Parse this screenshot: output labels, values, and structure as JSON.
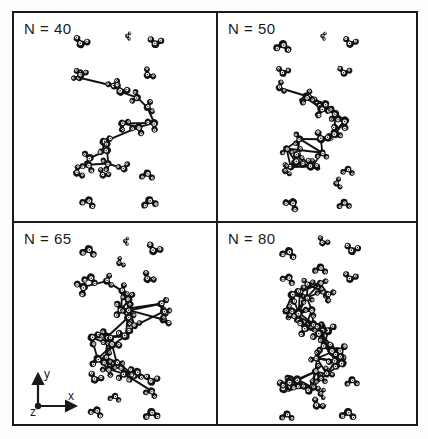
{
  "figure": {
    "type": "molecular-snapshot-grid",
    "border_color": "#1a1a1a",
    "background_color": "#ffffff",
    "molecule_color": "#111111",
    "highlight_color": "#ffffff"
  },
  "axes": {
    "x_label": "x",
    "y_label": "y",
    "z_label": "z",
    "shown_in_panel": "N = 65"
  },
  "panels": [
    {
      "id": "panel-n40",
      "label": "N = 40",
      "n": 40,
      "position": "top-left",
      "cluster": {
        "shape": "branched-chain",
        "center_x": 0.52,
        "center_y": 0.56,
        "molecules": 14,
        "spread_x": 0.16,
        "spread_y": 0.22,
        "seed": 11
      },
      "free_molecules": [
        {
          "x": 0.33,
          "y": 0.15,
          "rot": 20,
          "size": 1.15
        },
        {
          "x": 0.56,
          "y": 0.11,
          "rot": 95,
          "size": 0.6
        },
        {
          "x": 0.7,
          "y": 0.15,
          "rot": 8,
          "size": 1.1
        },
        {
          "x": 0.33,
          "y": 0.3,
          "rot": 10,
          "size": 1.0
        },
        {
          "x": 0.66,
          "y": 0.3,
          "rot": 48,
          "size": 1.0
        },
        {
          "x": 0.31,
          "y": 0.77,
          "rot": 62,
          "size": 1.0
        },
        {
          "x": 0.44,
          "y": 0.78,
          "rot": 30,
          "size": 0.95
        },
        {
          "x": 0.66,
          "y": 0.77,
          "rot": 186,
          "size": 1.05
        },
        {
          "x": 0.37,
          "y": 0.9,
          "rot": 200,
          "size": 1.1
        },
        {
          "x": 0.67,
          "y": 0.9,
          "rot": 172,
          "size": 1.15
        }
      ]
    },
    {
      "id": "panel-n50",
      "label": "N = 50",
      "n": 50,
      "position": "top-right",
      "cluster": {
        "shape": "compact-diamond",
        "center_x": 0.5,
        "center_y": 0.56,
        "molecules": 18,
        "spread_x": 0.17,
        "spread_y": 0.19,
        "seed": 23
      },
      "free_molecules": [
        {
          "x": 0.33,
          "y": 0.15,
          "rot": 188,
          "size": 1.2
        },
        {
          "x": 0.53,
          "y": 0.11,
          "rot": 100,
          "size": 0.6
        },
        {
          "x": 0.67,
          "y": 0.15,
          "rot": 15,
          "size": 1.05
        },
        {
          "x": 0.33,
          "y": 0.29,
          "rot": 10,
          "size": 1.0
        },
        {
          "x": 0.64,
          "y": 0.29,
          "rot": 12,
          "size": 1.0
        },
        {
          "x": 0.34,
          "y": 0.76,
          "rot": 70,
          "size": 0.85
        },
        {
          "x": 0.47,
          "y": 0.74,
          "rot": 32,
          "size": 1.05
        },
        {
          "x": 0.66,
          "y": 0.75,
          "rot": 188,
          "size": 0.95
        },
        {
          "x": 0.6,
          "y": 0.82,
          "rot": 80,
          "size": 0.85
        },
        {
          "x": 0.38,
          "y": 0.91,
          "rot": 215,
          "size": 1.15
        },
        {
          "x": 0.64,
          "y": 0.91,
          "rot": 178,
          "size": 1.0
        }
      ]
    },
    {
      "id": "panel-n65",
      "label": "N = 65",
      "n": 65,
      "position": "bottom-left",
      "cluster": {
        "shape": "large-ring-branched",
        "center_x": 0.53,
        "center_y": 0.55,
        "molecules": 24,
        "spread_x": 0.19,
        "spread_y": 0.24,
        "seed": 37
      },
      "free_molecules": [
        {
          "x": 0.37,
          "y": 0.13,
          "rot": 190,
          "size": 1.15
        },
        {
          "x": 0.55,
          "y": 0.09,
          "rot": 95,
          "size": 0.6
        },
        {
          "x": 0.69,
          "y": 0.14,
          "rot": 25,
          "size": 1.15
        },
        {
          "x": 0.52,
          "y": 0.2,
          "rot": 60,
          "size": 0.8
        },
        {
          "x": 0.38,
          "y": 0.27,
          "rot": 198,
          "size": 1.1
        },
        {
          "x": 0.66,
          "y": 0.28,
          "rot": 40,
          "size": 1.05
        },
        {
          "x": 0.4,
          "y": 0.78,
          "rot": 24,
          "size": 1.1
        },
        {
          "x": 0.68,
          "y": 0.79,
          "rot": 10,
          "size": 1.1
        },
        {
          "x": 0.5,
          "y": 0.86,
          "rot": 190,
          "size": 0.9
        },
        {
          "x": 0.41,
          "y": 0.93,
          "rot": 200,
          "size": 1.05
        },
        {
          "x": 0.68,
          "y": 0.94,
          "rot": 176,
          "size": 1.15
        }
      ]
    },
    {
      "id": "panel-n80",
      "label": "N = 80",
      "n": 80,
      "position": "bottom-right",
      "cluster": {
        "shape": "large-elongated",
        "center_x": 0.5,
        "center_y": 0.55,
        "molecules": 30,
        "spread_x": 0.18,
        "spread_y": 0.28,
        "seed": 53
      },
      "free_molecules": [
        {
          "x": 0.36,
          "y": 0.14,
          "rot": 195,
          "size": 1.15
        },
        {
          "x": 0.53,
          "y": 0.1,
          "rot": 30,
          "size": 0.9
        },
        {
          "x": 0.68,
          "y": 0.14,
          "rot": 12,
          "size": 1.1
        },
        {
          "x": 0.52,
          "y": 0.22,
          "rot": 185,
          "size": 1.05
        },
        {
          "x": 0.36,
          "y": 0.27,
          "rot": 205,
          "size": 1.05
        },
        {
          "x": 0.67,
          "y": 0.28,
          "rot": 14,
          "size": 1.05
        },
        {
          "x": 0.36,
          "y": 0.79,
          "rot": 192,
          "size": 1.15
        },
        {
          "x": 0.52,
          "y": 0.77,
          "rot": 180,
          "size": 0.95
        },
        {
          "x": 0.68,
          "y": 0.78,
          "rot": 178,
          "size": 1.0
        },
        {
          "x": 0.52,
          "y": 0.85,
          "rot": 92,
          "size": 0.8
        },
        {
          "x": 0.5,
          "y": 0.91,
          "rot": 40,
          "size": 1.05
        },
        {
          "x": 0.35,
          "y": 0.95,
          "rot": 182,
          "size": 1.0
        },
        {
          "x": 0.66,
          "y": 0.94,
          "rot": 186,
          "size": 1.15
        }
      ]
    }
  ]
}
